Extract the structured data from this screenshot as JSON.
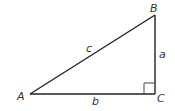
{
  "diagram": {
    "type": "right-triangle",
    "vertices": {
      "A": {
        "label": "A",
        "x": 30,
        "y": 94
      },
      "B": {
        "label": "B",
        "x": 155,
        "y": 15
      },
      "C": {
        "label": "C",
        "x": 155,
        "y": 94
      }
    },
    "sides": {
      "a": {
        "label": "a",
        "from": "B",
        "to": "C"
      },
      "b": {
        "label": "b",
        "from": "A",
        "to": "C"
      },
      "c": {
        "label": "c",
        "from": "A",
        "to": "B"
      }
    },
    "right_angle_at": "C",
    "colors": {
      "line": "#222222",
      "text": "#333333",
      "background": "#ffffff"
    }
  }
}
